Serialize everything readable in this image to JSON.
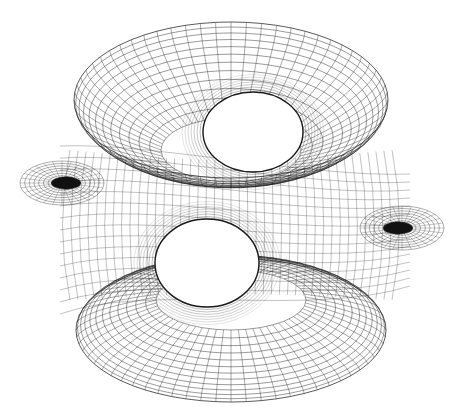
{
  "figure": {
    "background": "#ffffff",
    "stroke": "#1a1a1a",
    "width": 462,
    "height": 415
  },
  "parts": {
    "top_ring": {
      "cx": 231,
      "cy": 100,
      "rx_outer": 157,
      "ry_outer": 78,
      "rx_inner": 70,
      "ry_inner": 32,
      "inner_cy": 150
    },
    "bottom_ring": {
      "cx": 231,
      "cy": 330,
      "rx_outer": 155,
      "ry_outer": 72,
      "rx_inner": 75,
      "ry_inner": 30,
      "inner_cy": 300
    },
    "front_hole": {
      "cx": 207,
      "cy": 263,
      "rx": 52,
      "ry": 44
    },
    "back_hole": {
      "cx": 253,
      "cy": 132,
      "rx": 50,
      "ry": 40
    },
    "left_wing": {
      "cx": 62,
      "cy": 183,
      "rx": 42,
      "ry": 22
    },
    "right_wing": {
      "cx": 402,
      "cy": 228,
      "rx": 42,
      "ry": 22
    }
  }
}
